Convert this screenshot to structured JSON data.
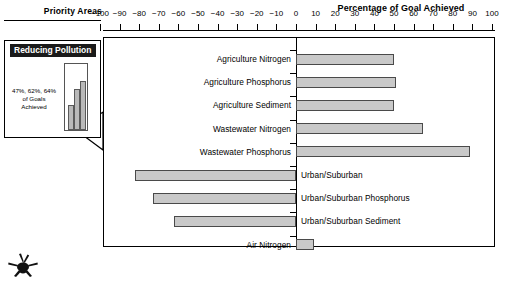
{
  "header": {
    "priority_areas_label": "Priority Areas",
    "chart_title": "Percentage of Goal Achieved"
  },
  "inset": {
    "title": "Reducing Pollution",
    "note": "47%, 62%, 64%\nof Goals\nAchieved",
    "note_line1": "47%, 62%, 64%",
    "note_line2": "of Goals",
    "note_line3": "Achieved",
    "mini_values": [
      38,
      62,
      74
    ]
  },
  "icons": {
    "crab": "crab-icon"
  },
  "colors": {
    "bar_fill": "#c9c9c9",
    "bar_stroke": "#4a4a4a",
    "header_bg": "#1a1a1a",
    "axis": "#000000"
  },
  "chart_data": {
    "type": "bar",
    "orientation": "horizontal",
    "title": "Percentage of Goal Achieved",
    "xlabel": "Percentage of Goal Achieved",
    "ylabel": "Priority Areas",
    "xlim": [
      -100,
      100
    ],
    "grid": false,
    "legend": "none",
    "tick_labels": [
      "-100",
      "-90",
      "-80",
      "-70",
      "-60",
      "-50",
      "-40",
      "-30",
      "-20",
      "-10",
      "0",
      "10",
      "20",
      "30",
      "40",
      "50",
      "60",
      "70",
      "80",
      "90",
      "100"
    ],
    "ticks": [
      -100,
      -90,
      -80,
      -70,
      -60,
      -50,
      -40,
      -30,
      -20,
      -10,
      0,
      10,
      20,
      30,
      40,
      50,
      60,
      70,
      80,
      90,
      100
    ],
    "categories": [
      "Agriculture Nitrogen",
      "Agriculture Phosphorus",
      "Agriculture Sediment",
      "Wastewater Nitrogen",
      "Wastewater Phosphorus",
      "Urban/Suburban",
      "Urban/Suburban Phosphorus",
      "Urban/Suburban Sediment",
      "Air Nitrogen"
    ],
    "values": [
      50,
      51,
      50,
      65,
      89,
      -82,
      -73,
      -62,
      9
    ]
  }
}
